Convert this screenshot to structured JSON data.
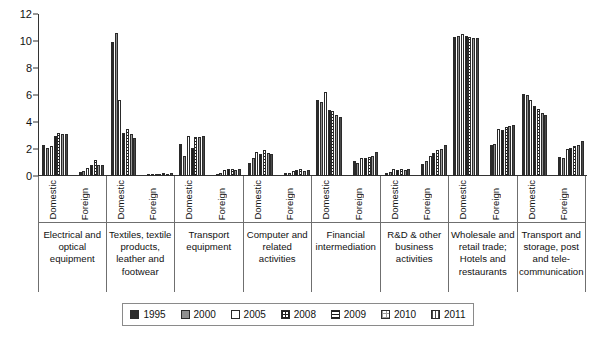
{
  "chart_data": {
    "type": "bar",
    "title": "",
    "xlabel": "",
    "ylabel": "",
    "ylim": [
      0,
      12
    ],
    "yticks": [
      0,
      2,
      4,
      6,
      8,
      10,
      12
    ],
    "grid": false,
    "legend_position": "bottom",
    "legend_entries": [
      "1995",
      "2000",
      "2005",
      "2008",
      "2009",
      "2010",
      "2011"
    ],
    "series_names": [
      "1995",
      "2000",
      "2005",
      "2008",
      "2009",
      "2010",
      "2011"
    ],
    "series_patterns": [
      "solid-black",
      "solid-gray",
      "white",
      "checkered-dots",
      "horizontal-lines",
      "light-dots",
      "vertical-lines"
    ],
    "subgroup_labels": [
      "Domestic",
      "Foreign"
    ],
    "categories": [
      "Electrical and optical equipment",
      "Textiles, textile products, leather and footwear",
      "Transport equipment",
      "Computer and related activities",
      "Financial intermediation",
      "R&D & other business activities",
      "Wholesale and retail trade; Hotels and restaurants",
      "Transport and storage, post and tele-communication"
    ],
    "groups": [
      {
        "category": "Electrical and optical equipment",
        "Domestic": [
          2.3,
          2.1,
          2.2,
          3.0,
          3.2,
          3.1,
          3.1
        ],
        "Foreign": [
          0.3,
          0.35,
          0.6,
          0.85,
          1.15,
          0.85,
          0.8
        ]
      },
      {
        "category": "Textiles, textile products, leather and footwear",
        "Domestic": [
          9.9,
          10.6,
          5.6,
          3.2,
          3.5,
          3.1,
          2.8
        ],
        "Foreign": [
          0.12,
          0.15,
          0.18,
          0.18,
          0.2,
          0.18,
          0.2
        ]
      },
      {
        "category": "Transport equipment",
        "Domestic": [
          2.4,
          1.5,
          3.0,
          2.1,
          2.9,
          2.9,
          3.0
        ],
        "Foreign": [
          0.15,
          0.25,
          0.45,
          0.5,
          0.55,
          0.45,
          0.5
        ]
      },
      {
        "category": "Computer and related activities",
        "Domestic": [
          1.0,
          1.3,
          1.8,
          1.6,
          1.9,
          1.7,
          1.6
        ],
        "Foreign": [
          0.2,
          0.25,
          0.4,
          0.45,
          0.5,
          0.4,
          0.45
        ]
      },
      {
        "category": "Financial intermediation",
        "Domestic": [
          5.6,
          5.5,
          6.2,
          4.9,
          4.8,
          4.5,
          4.4
        ],
        "Foreign": [
          1.1,
          1.0,
          1.3,
          1.3,
          1.4,
          1.5,
          1.8
        ]
      },
      {
        "category": "R&D & other business activities",
        "Domestic": [
          0.25,
          0.3,
          0.5,
          0.45,
          0.5,
          0.45,
          0.5
        ],
        "Foreign": [
          0.9,
          1.1,
          1.5,
          1.7,
          1.9,
          2.0,
          2.3
        ]
      },
      {
        "category": "Wholesale and retail trade; Hotels and restaurants",
        "Domestic": [
          10.3,
          10.4,
          10.5,
          10.4,
          10.3,
          10.2,
          10.2
        ],
        "Foreign": [
          2.3,
          2.4,
          3.5,
          3.4,
          3.6,
          3.7,
          3.8
        ]
      },
      {
        "category": "Transport and storage, post and tele-communication",
        "Domestic": [
          6.1,
          6.0,
          5.6,
          5.2,
          5.0,
          4.7,
          4.5
        ],
        "Foreign": [
          1.4,
          1.3,
          2.0,
          2.1,
          2.2,
          2.3,
          2.6
        ]
      }
    ]
  },
  "colors": {
    "axis": "#333333",
    "text": "#111111",
    "grid_border": "#6f6f6f",
    "series": [
      "#2b2b2b",
      "#8f8f8f",
      "#ffffff",
      "#ffffff",
      "#ffffff",
      "#ffffff",
      "#ffffff"
    ]
  }
}
